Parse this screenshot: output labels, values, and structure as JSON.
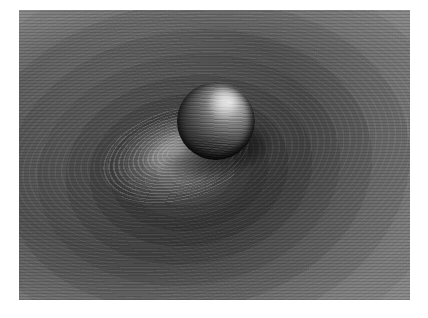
{
  "figure": {
    "title": "Sphere resting in a contoured potential well",
    "medium": "grayscale 3D render",
    "caption": "",
    "background_color": "#ffffff",
    "plate": {
      "x": 19,
      "y": 10,
      "width": 391,
      "height": 290,
      "base_color": "#585858"
    }
  },
  "scene": {
    "objects": [
      {
        "name": "sphere",
        "label": "Sphere",
        "center_x": 216,
        "center_y": 121,
        "radius": 39,
        "shading": "specular",
        "highlight_position": "upper-right",
        "surface_pattern": "horizontal contour bands",
        "colors": {
          "highlight": "#d8d8d8",
          "midtone": "#5c5c5c",
          "terminator": "#2a2a2a",
          "limb": "#0e0e0e"
        }
      },
      {
        "name": "potential-well",
        "label": "Potential well surface",
        "center_x": 168,
        "center_y": 152,
        "pattern": "concentric elliptical contour bands",
        "orientation_deg": -9,
        "colors": {
          "floor_dark": "#3c3c3c",
          "mid": "#585858",
          "rim": "#7a7a7a",
          "contour_line": "rgba(255,255,255,0.055)"
        }
      },
      {
        "name": "secondary-hill",
        "label": "Secondary contoured hill (right edge)",
        "center_x": 430,
        "center_y": 150,
        "pattern": "concentric elliptical contour bands",
        "colors": {
          "light": "#8e8e8e",
          "mid": "#7b7b7b",
          "dark": "#666666"
        }
      },
      {
        "name": "floor-highlight",
        "label": "Specular highlight on well floor",
        "center_x": 176,
        "center_y": 156,
        "colors": {
          "core": "#e1e1e1"
        }
      },
      {
        "name": "contact-shadow",
        "label": "Contact shadow beneath sphere",
        "center_x": 216,
        "center_y": 162
      }
    ],
    "lighting": {
      "direction": "upper-right",
      "type": "single key light with specular falloff"
    }
  },
  "palette": {
    "white": "#ffffff",
    "lightest_gray": "#8e8e8e",
    "light_gray": "#7a7a7a",
    "mid_gray": "#585858",
    "dark_gray": "#424242",
    "darkest_gray": "#0e0e0e"
  }
}
